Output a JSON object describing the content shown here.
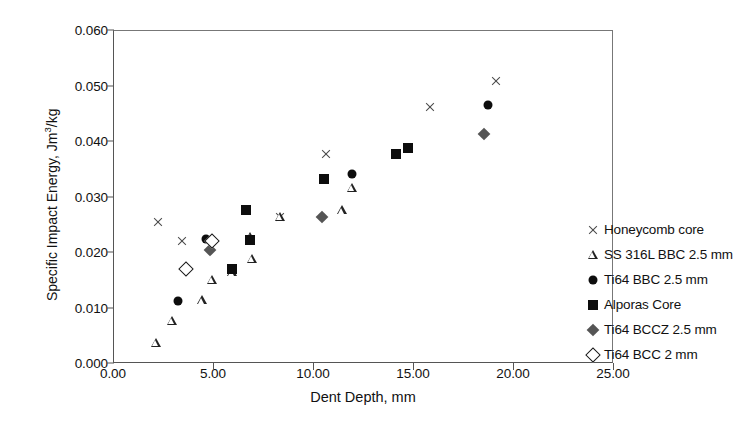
{
  "chart_data": {
    "type": "scatter",
    "title": "",
    "xlabel": "Dent Depth, mm",
    "ylabel": "Specific Impact Energy, Jm3/kg",
    "ylabel_base": "Specific Impact Energy, Jm",
    "ylabel_sup": "3",
    "ylabel_tail": "/kg",
    "xlim": [
      0,
      25
    ],
    "ylim": [
      0,
      0.06
    ],
    "xticks": [
      "0.00",
      "5.00",
      "10.00",
      "15.00",
      "20.00",
      "25.00"
    ],
    "xtick_values": [
      0,
      5,
      10,
      15,
      20,
      25
    ],
    "yticks": [
      "0.000",
      "0.010",
      "0.020",
      "0.030",
      "0.040",
      "0.050",
      "0.060"
    ],
    "ytick_values": [
      0,
      0.01,
      0.02,
      0.03,
      0.04,
      0.05,
      0.06
    ],
    "grid": false,
    "legend_position": "inside-right",
    "series": [
      {
        "name": "Honeycomb core",
        "marker": "cross",
        "color": "#4a4a4a",
        "points": [
          {
            "x": 2.2,
            "y": 0.0255
          },
          {
            "x": 3.4,
            "y": 0.0222
          },
          {
            "x": 8.3,
            "y": 0.0265
          },
          {
            "x": 10.6,
            "y": 0.0378
          },
          {
            "x": 15.8,
            "y": 0.0463
          },
          {
            "x": 19.1,
            "y": 0.051
          }
        ]
      },
      {
        "name": "SS 316L BBC 2.5 mm",
        "marker": "triangle-open",
        "color": "#222222",
        "points": [
          {
            "x": 2.1,
            "y": 0.0038
          },
          {
            "x": 2.9,
            "y": 0.0078
          },
          {
            "x": 4.4,
            "y": 0.0115
          },
          {
            "x": 4.9,
            "y": 0.0152
          },
          {
            "x": 5.9,
            "y": 0.0165
          },
          {
            "x": 6.8,
            "y": 0.0229
          },
          {
            "x": 6.9,
            "y": 0.019
          },
          {
            "x": 8.3,
            "y": 0.0265
          },
          {
            "x": 11.4,
            "y": 0.0277
          },
          {
            "x": 11.9,
            "y": 0.0317
          }
        ]
      },
      {
        "name": "Ti64 BBC 2.5 mm",
        "marker": "circle-filled",
        "color": "#0d0d0d",
        "points": [
          {
            "x": 3.2,
            "y": 0.0114
          },
          {
            "x": 4.6,
            "y": 0.0226
          },
          {
            "x": 10.5,
            "y": 0.0333
          },
          {
            "x": 11.9,
            "y": 0.0342
          },
          {
            "x": 18.7,
            "y": 0.0466
          }
        ]
      },
      {
        "name": "Alporas Core",
        "marker": "square-filled",
        "color": "#0d0d0d",
        "points": [
          {
            "x": 5.9,
            "y": 0.0172
          },
          {
            "x": 6.6,
            "y": 0.0278
          },
          {
            "x": 6.8,
            "y": 0.0223
          },
          {
            "x": 10.5,
            "y": 0.0333
          },
          {
            "x": 14.1,
            "y": 0.0379
          },
          {
            "x": 14.7,
            "y": 0.039
          }
        ]
      },
      {
        "name": "Ti64 BCCZ 2.5 mm",
        "marker": "diamond-filled",
        "color": "#555555",
        "points": [
          {
            "x": 4.8,
            "y": 0.0205
          },
          {
            "x": 10.4,
            "y": 0.0264
          },
          {
            "x": 18.5,
            "y": 0.0415
          }
        ]
      },
      {
        "name": "Ti64 BCC 2 mm",
        "marker": "diamond-open",
        "color": "#1a1a1a",
        "points": [
          {
            "x": 3.6,
            "y": 0.0172
          },
          {
            "x": 4.9,
            "y": 0.0222
          }
        ]
      }
    ],
    "legend": [
      {
        "label": "Honeycomb core",
        "marker": "cross"
      },
      {
        "label": "SS 316L BBC 2.5 mm",
        "marker": "triangle-open"
      },
      {
        "label": "Ti64 BBC 2.5 mm",
        "marker": "circle-filled"
      },
      {
        "label": "Alporas Core",
        "marker": "square-filled"
      },
      {
        "label": "Ti64 BCCZ 2.5 mm",
        "marker": "diamond-filled"
      },
      {
        "label": "Ti64 BCC 2 mm",
        "marker": "diamond-open"
      }
    ]
  }
}
